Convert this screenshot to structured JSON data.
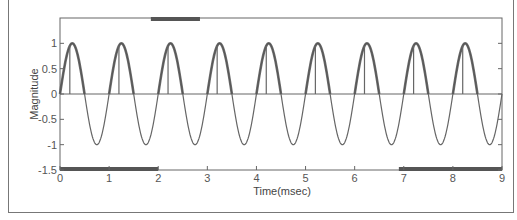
{
  "chart_data": {
    "type": "line",
    "title": "",
    "xlabel": "Time(msec)",
    "ylabel": "Magnitude",
    "xlim": [
      0,
      9
    ],
    "ylim": [
      -1.5,
      1.5
    ],
    "xticks": [
      "0",
      "1",
      "2",
      "3",
      "4",
      "5",
      "6",
      "7",
      "8",
      "9"
    ],
    "yticks": [
      "1",
      "0.5",
      "0",
      "-0.5",
      "-1",
      "-1.5"
    ],
    "grid": false,
    "legend": null,
    "series": [
      {
        "name": "sine",
        "description": "Sinusoid, amplitude 1, period 1 msec, starting at 0 at t=0; positive half-cycles drawn bold",
        "amplitude": 1,
        "period_ms": 1,
        "phase": 0,
        "peaks_t": [
          0.25,
          1.25,
          2.25,
          3.25,
          4.25,
          5.25,
          6.25,
          7.25,
          8.25
        ],
        "troughs_t": [
          0.75,
          1.75,
          2.75,
          3.75,
          4.75,
          5.75,
          6.75,
          7.75,
          8.75
        ]
      },
      {
        "name": "zero-line",
        "description": "Flat line at magnitude 0",
        "values": [
          0,
          0
        ]
      },
      {
        "name": "stems",
        "description": "Vertical stems from 0 to ~1 near each positive peak",
        "t": [
          0.2,
          1.2,
          2.2,
          3.2,
          4.2,
          5.2,
          6.2,
          7.2,
          8.2
        ],
        "values": [
          0.95,
          0.95,
          0.95,
          0.95,
          0.95,
          0.95,
          0.95,
          0.95,
          0.95
        ]
      }
    ],
    "annotations": [
      {
        "type": "bold-bar",
        "position": "bottom",
        "t_range": [
          0,
          2
        ]
      },
      {
        "type": "bold-bar",
        "position": "bottom",
        "t_range": [
          6.9,
          9
        ]
      },
      {
        "type": "bold-bar",
        "position": "top",
        "t_range": [
          1.85,
          2.85
        ]
      }
    ]
  },
  "colors": {
    "line": "#666666",
    "bold": "#555555",
    "axis": "#666666",
    "text": "#555555"
  }
}
